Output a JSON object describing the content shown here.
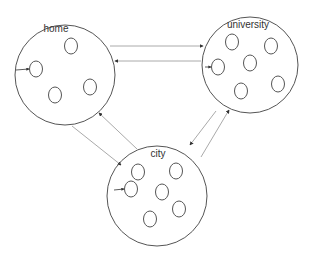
{
  "diagram": {
    "colors": {
      "stroke": "#555555",
      "edge": "#aaaaaa",
      "background": "#ffffff"
    },
    "nodes": [
      {
        "id": "home",
        "label": "home",
        "cx": 65,
        "cy": 75,
        "r": 50,
        "label_x": 56,
        "label_y": 32,
        "members": [
          [
            71,
            46
          ],
          [
            36,
            69
          ],
          [
            55,
            95
          ],
          [
            90,
            87
          ]
        ],
        "entry": [
          16,
          70
        ]
      },
      {
        "id": "university",
        "label": "university",
        "cx": 250,
        "cy": 65,
        "r": 48,
        "label_x": 248,
        "label_y": 28,
        "members": [
          [
            232,
            42
          ],
          [
            271,
            46
          ],
          [
            218,
            67
          ],
          [
            250,
            63
          ],
          [
            278,
            84
          ],
          [
            241,
            91
          ]
        ],
        "entry": [
          205,
          67
        ]
      },
      {
        "id": "city",
        "label": "city",
        "cx": 157,
        "cy": 196,
        "r": 50,
        "label_x": 158,
        "label_y": 157,
        "members": [
          [
            138,
            172
          ],
          [
            176,
            171
          ],
          [
            131,
            189
          ],
          [
            162,
            192
          ],
          [
            179,
            209
          ],
          [
            150,
            219
          ]
        ],
        "entry": [
          114,
          190
        ]
      }
    ],
    "edges": [
      {
        "from": "home",
        "to": "university",
        "x1": 110,
        "y1": 46,
        "x2": 203,
        "y2": 46
      },
      {
        "from": "university",
        "to": "home",
        "x1": 201,
        "y1": 61,
        "x2": 115,
        "y2": 61
      },
      {
        "from": "home",
        "to": "city",
        "x1": 72,
        "y1": 126,
        "x2": 121,
        "y2": 165
      },
      {
        "from": "city",
        "to": "home",
        "x1": 137,
        "y1": 149,
        "x2": 99,
        "y2": 113
      },
      {
        "from": "city",
        "to": "university",
        "x1": 201,
        "y1": 157,
        "x2": 229,
        "y2": 110
      },
      {
        "from": "university",
        "to": "city",
        "x1": 216,
        "y1": 111,
        "x2": 190,
        "y2": 145
      }
    ]
  }
}
